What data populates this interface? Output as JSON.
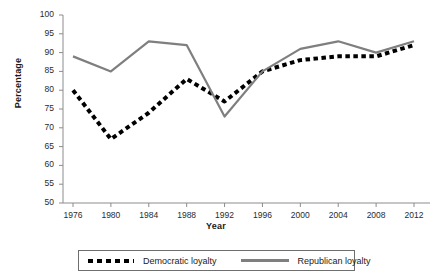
{
  "title_remnant": "",
  "axis": {
    "ylabel": "Percentage",
    "xlabel": "Year",
    "yticks": [
      "100",
      "95",
      "90",
      "85",
      "80",
      "75",
      "70",
      "65",
      "60",
      "55",
      "50"
    ],
    "xticks": [
      "1976",
      "1980",
      "1984",
      "1988",
      "1992",
      "1996",
      "2000",
      "2004",
      "2008",
      "2012"
    ]
  },
  "legend": {
    "dem_label": "Democratic loyalty",
    "rep_label": "Republican loyalty"
  },
  "colors": {
    "democratic": "#000000",
    "republican": "#7f7f7f",
    "axis": "#8c8c8c",
    "text": "#1a1a1a"
  },
  "chart_data": {
    "type": "line",
    "title": "",
    "xlabel": "Year",
    "ylabel": "Percentage",
    "ylim": [
      50,
      100
    ],
    "ytick_step": 5,
    "grid": false,
    "legend_position": "bottom",
    "x": [
      1976,
      1980,
      1984,
      1988,
      1992,
      1996,
      2000,
      2004,
      2008,
      2012
    ],
    "categories": [
      "1976",
      "1980",
      "1984",
      "1988",
      "1992",
      "1996",
      "2000",
      "2004",
      "2008",
      "2012"
    ],
    "series": [
      {
        "name": "Democratic loyalty",
        "style": "dotted",
        "color": "#000000",
        "values": [
          80,
          67,
          74,
          83,
          77,
          85,
          88,
          89,
          89,
          92
        ]
      },
      {
        "name": "Republican loyalty",
        "style": "solid",
        "color": "#7f7f7f",
        "values": [
          89,
          85,
          93,
          92,
          73,
          85,
          91,
          93,
          90,
          93
        ]
      }
    ]
  }
}
